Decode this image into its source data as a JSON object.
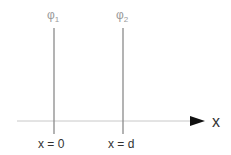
{
  "diagram": {
    "potentials": [
      {
        "symbol": "φ",
        "subscript": "1",
        "position_label": "x = 0"
      },
      {
        "symbol": "φ",
        "subscript": "2",
        "position_label": "x = d"
      }
    ],
    "axis": {
      "label": "x"
    },
    "colors": {
      "plate": "#8a8a8a",
      "potential_label": "#9a9a9a",
      "axis": "#c8c8c8",
      "arrow": "#111111",
      "text": "#333333"
    }
  }
}
